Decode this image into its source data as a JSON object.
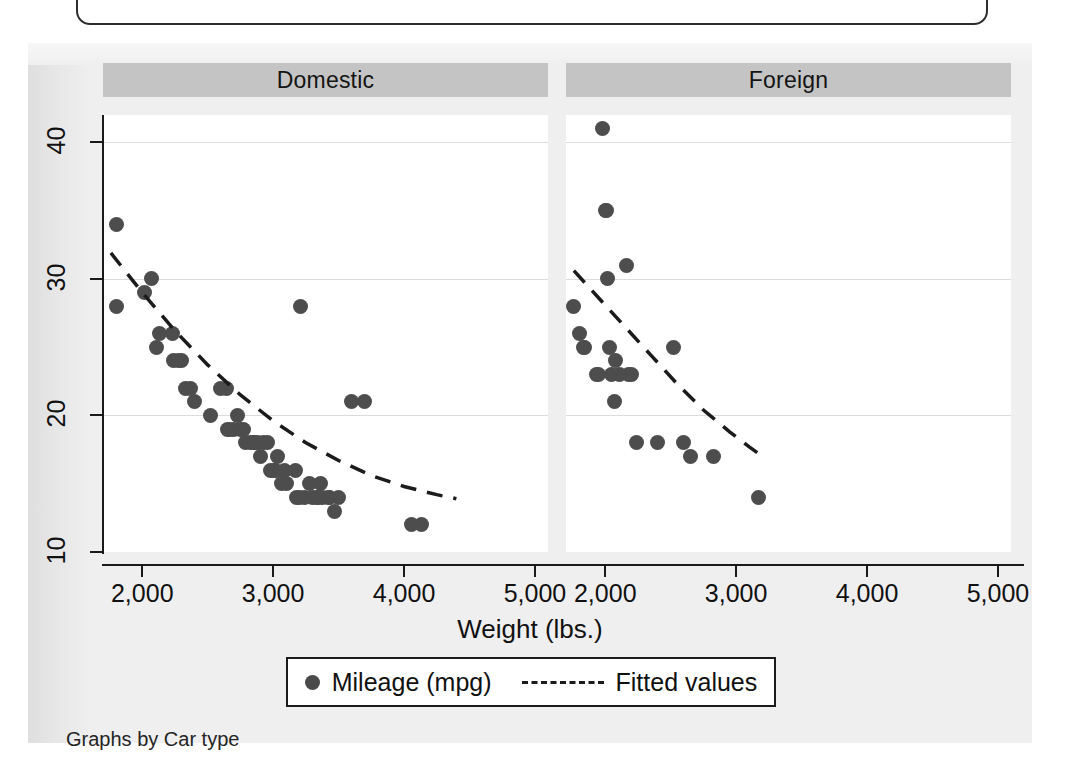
{
  "caption": "Graphs by Car type",
  "axis": {
    "x_title": "Weight (lbs.)",
    "x_ticks": [
      "2,000",
      "3,000",
      "4,000",
      "5,000"
    ],
    "y_ticks": [
      "10",
      "20",
      "30",
      "40"
    ]
  },
  "legend": {
    "marker_label": "Mileage (mpg)",
    "line_label": "Fitted values"
  },
  "panels": [
    {
      "title": "Domestic"
    },
    {
      "title": "Foreign"
    }
  ],
  "colors": {
    "marker": "#4d4d4d",
    "panel_header": "#c4c4c4",
    "axis": "#1a1a1a",
    "grid": "#dcdcdc",
    "page": "#efefef",
    "plot_bg": "#ffffff"
  },
  "chart_data": {
    "type": "scatter",
    "title": "",
    "xlabel": "Weight (lbs.)",
    "ylabel": "Mileage (mpg)",
    "xlim": [
      1700,
      5100
    ],
    "ylim": [
      10,
      42
    ],
    "grid": true,
    "legend_position": "bottom",
    "xticks": [
      2000,
      3000,
      4000,
      5000
    ],
    "yticks": [
      10,
      20,
      30,
      40
    ],
    "facets": [
      {
        "name": "Domestic",
        "points": [
          [
            1800,
            28
          ],
          [
            1800,
            34
          ],
          [
            2020,
            29
          ],
          [
            2070,
            30
          ],
          [
            2110,
            25
          ],
          [
            2130,
            26
          ],
          [
            2230,
            26
          ],
          [
            2240,
            24
          ],
          [
            2280,
            24
          ],
          [
            2300,
            24
          ],
          [
            2330,
            22
          ],
          [
            2370,
            22
          ],
          [
            2400,
            21
          ],
          [
            2520,
            20
          ],
          [
            2600,
            22
          ],
          [
            2640,
            22
          ],
          [
            2650,
            19
          ],
          [
            2670,
            19
          ],
          [
            2700,
            19
          ],
          [
            2730,
            20
          ],
          [
            2750,
            19
          ],
          [
            2770,
            19
          ],
          [
            2790,
            18
          ],
          [
            2830,
            18
          ],
          [
            2850,
            18
          ],
          [
            2860,
            18
          ],
          [
            2880,
            18
          ],
          [
            2900,
            17
          ],
          [
            2930,
            18
          ],
          [
            2960,
            18
          ],
          [
            2980,
            16
          ],
          [
            3000,
            16
          ],
          [
            3020,
            16
          ],
          [
            3030,
            17
          ],
          [
            3060,
            15
          ],
          [
            3090,
            16
          ],
          [
            3100,
            15
          ],
          [
            3170,
            16
          ],
          [
            3180,
            14
          ],
          [
            3200,
            14
          ],
          [
            3210,
            28
          ],
          [
            3240,
            14
          ],
          [
            3280,
            15
          ],
          [
            3300,
            14
          ],
          [
            3330,
            14
          ],
          [
            3350,
            14
          ],
          [
            3360,
            15
          ],
          [
            3380,
            14
          ],
          [
            3420,
            14
          ],
          [
            3430,
            14
          ],
          [
            3470,
            13
          ],
          [
            3500,
            14
          ],
          [
            3600,
            21
          ],
          [
            3700,
            21
          ],
          [
            4060,
            12
          ],
          [
            4130,
            12
          ]
        ],
        "fit_curve": [
          [
            1760,
            31.9
          ],
          [
            2000,
            29.0
          ],
          [
            2250,
            26.2
          ],
          [
            2500,
            23.7
          ],
          [
            2750,
            21.5
          ],
          [
            3000,
            19.6
          ],
          [
            3250,
            18.0
          ],
          [
            3500,
            16.7
          ],
          [
            3750,
            15.6
          ],
          [
            4000,
            14.8
          ],
          [
            4250,
            14.2
          ],
          [
            4400,
            13.9
          ]
        ]
      },
      {
        "name": "Foreign",
        "points": [
          [
            1760,
            28
          ],
          [
            1800,
            26
          ],
          [
            1830,
            25
          ],
          [
            1840,
            25
          ],
          [
            1930,
            23
          ],
          [
            1950,
            23
          ],
          [
            1980,
            41
          ],
          [
            2000,
            35
          ],
          [
            2010,
            35
          ],
          [
            2020,
            30
          ],
          [
            2030,
            25
          ],
          [
            2050,
            23
          ],
          [
            2070,
            21
          ],
          [
            2080,
            24
          ],
          [
            2110,
            23
          ],
          [
            2160,
            31
          ],
          [
            2180,
            23
          ],
          [
            2200,
            23
          ],
          [
            2240,
            18
          ],
          [
            2400,
            18
          ],
          [
            2520,
            25
          ],
          [
            2600,
            18
          ],
          [
            2650,
            17
          ],
          [
            2830,
            17
          ],
          [
            3170,
            14
          ]
        ],
        "fit_curve": [
          [
            1760,
            30.6
          ],
          [
            1950,
            28.6
          ],
          [
            2150,
            26.5
          ],
          [
            2350,
            24.4
          ],
          [
            2550,
            22.3
          ],
          [
            2750,
            20.4
          ],
          [
            2950,
            18.8
          ],
          [
            3100,
            17.7
          ],
          [
            3200,
            17.0
          ]
        ]
      }
    ]
  }
}
